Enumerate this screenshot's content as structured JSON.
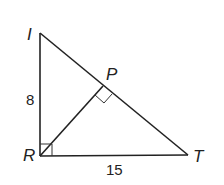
{
  "diagram": {
    "type": "right triangle with altitude",
    "vertices": {
      "I": {
        "label": "I",
        "x": 40,
        "y": 33
      },
      "R": {
        "label": "R",
        "x": 40,
        "y": 156
      },
      "T": {
        "label": "T",
        "x": 188,
        "y": 155
      },
      "P": {
        "label": "P",
        "x": 103,
        "y": 86
      }
    },
    "segments": [
      "IR",
      "RT",
      "IT",
      "RP"
    ],
    "right_angles": [
      "R",
      "P"
    ],
    "side_labels": {
      "IR": "8",
      "RT": "15"
    },
    "stroke_color": "#222222"
  }
}
